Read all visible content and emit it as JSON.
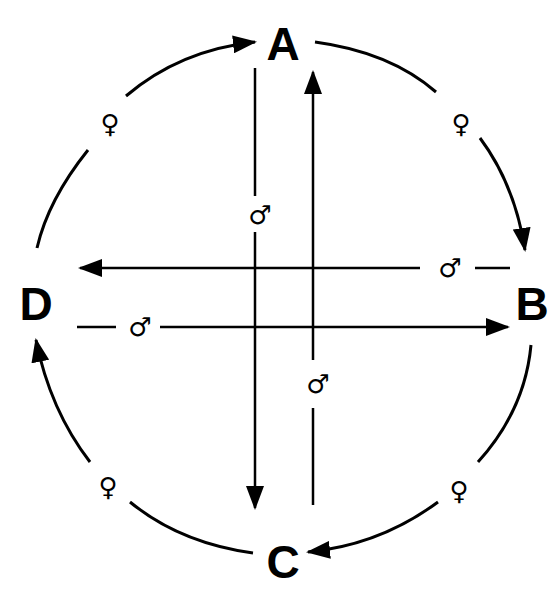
{
  "colors": {
    "ink": "#000000",
    "background": "#ffffff"
  },
  "nodes": [
    {
      "id": "A",
      "label": "A"
    },
    {
      "id": "B",
      "label": "B"
    },
    {
      "id": "C",
      "label": "C"
    },
    {
      "id": "D",
      "label": "D"
    }
  ],
  "symbols": {
    "female": "♀",
    "male": "♂"
  },
  "edges": {
    "outer_cycle": [
      {
        "from": "D",
        "to": "A",
        "label": "♀"
      },
      {
        "from": "A",
        "to": "B",
        "label": "♀"
      },
      {
        "from": "B",
        "to": "C",
        "label": "♀"
      },
      {
        "from": "C",
        "to": "D",
        "label": "♀"
      }
    ],
    "inner_cross": [
      {
        "from": "A",
        "to": "C",
        "label": "♂"
      },
      {
        "from": "C",
        "to": "A",
        "label": "♂"
      },
      {
        "from": "B",
        "to": "D",
        "label": "♂"
      },
      {
        "from": "D",
        "to": "B",
        "label": "♂"
      }
    ]
  }
}
